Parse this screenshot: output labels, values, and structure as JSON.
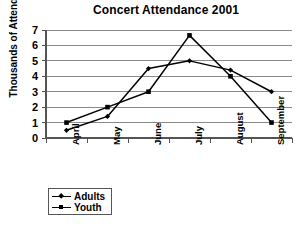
{
  "chart_data": {
    "type": "line",
    "title": "Concert Attendance 2001",
    "xlabel": "",
    "ylabel": "Thousands of Attendees",
    "categories": [
      "April",
      "May",
      "June",
      "July",
      "August",
      "September"
    ],
    "series": [
      {
        "name": "Adults",
        "marker": "diamond",
        "values": [
          0.5,
          1.4,
          4.5,
          5.0,
          4.4,
          3.0
        ]
      },
      {
        "name": "Youth",
        "marker": "square",
        "values": [
          1.0,
          2.0,
          3.0,
          6.65,
          4.0,
          1.0
        ]
      }
    ],
    "ylim": [
      0,
      7
    ],
    "y_ticks": [
      "0",
      "1",
      "2",
      "3",
      "4",
      "5",
      "6",
      "7"
    ],
    "grid": true,
    "legend_position": "below-left",
    "line_color": "#000000",
    "grid_color": "#8a8a8a"
  }
}
